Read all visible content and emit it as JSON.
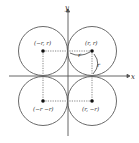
{
  "diagram": {
    "axes": {
      "x_label": "x",
      "y_label": "y"
    },
    "points": [
      {
        "id": "upper-right",
        "label": "(r, r)"
      },
      {
        "id": "upper-left",
        "label": "(−r, r)"
      },
      {
        "id": "lower-left",
        "label": "(−r −r)"
      },
      {
        "id": "lower-right",
        "label": "(r, −r)"
      }
    ],
    "radius_labels": {
      "horizontal": "r",
      "vertical": "r"
    },
    "colors": {
      "circle": "#6b6b6b",
      "axis": "#555555",
      "dotted": "#777777",
      "point": "#111111"
    }
  }
}
